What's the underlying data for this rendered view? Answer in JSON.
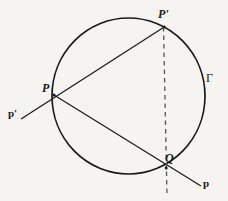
{
  "figure": {
    "kind": "geometry-diagram",
    "background_color": "#f5f4f1",
    "stroke_color": "#1a1a1a",
    "labels": {
      "point_p": "P",
      "point_p_prime": "P'",
      "point_q": "Q",
      "line_p": "p",
      "line_p_prime": "p'",
      "circle_gamma": "Γ"
    },
    "elements": {
      "circle_name": "circle-gamma",
      "chord_name": "chord-p-to-pprime",
      "secant_name": "secant-p-to-q",
      "dashed_name": "dashed-line-pprime-q"
    }
  }
}
